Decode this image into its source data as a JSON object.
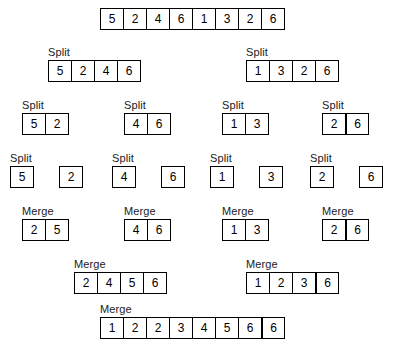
{
  "diagram": {
    "labels": {
      "split": "Split",
      "merge": "Merge"
    },
    "colors": {
      "background": "#ffffff",
      "border": "#000000",
      "text": "#000000"
    },
    "levels": [
      {
        "name": "initial-array",
        "label": "",
        "groups": [
          {
            "name": "root",
            "values": [
              5,
              2,
              4,
              6,
              1,
              3,
              2,
              6
            ],
            "thick_dividers": []
          }
        ]
      },
      {
        "name": "split-level-1",
        "label": "Split",
        "groups": [
          {
            "name": "left-half",
            "values": [
              5,
              2,
              4,
              6
            ],
            "thick_dividers": []
          },
          {
            "name": "right-half",
            "values": [
              1,
              3,
              2,
              6
            ],
            "thick_dividers": []
          }
        ]
      },
      {
        "name": "split-level-2",
        "label": "Split",
        "groups": [
          {
            "name": "pair-1",
            "values": [
              5,
              2
            ],
            "thick_dividers": []
          },
          {
            "name": "pair-2",
            "values": [
              4,
              6
            ],
            "thick_dividers": []
          },
          {
            "name": "pair-3",
            "values": [
              1,
              3
            ],
            "thick_dividers": []
          },
          {
            "name": "pair-4",
            "values": [
              2,
              6
            ],
            "thick_dividers": [
              1
            ]
          }
        ]
      },
      {
        "name": "split-level-3",
        "label": "Split",
        "groups": [
          {
            "name": "single-1",
            "values": [
              5,
              2
            ],
            "separated": true
          },
          {
            "name": "single-2",
            "values": [
              4,
              6
            ],
            "separated": true
          },
          {
            "name": "single-3",
            "values": [
              1,
              3
            ],
            "separated": true
          },
          {
            "name": "single-4",
            "values": [
              2,
              6
            ],
            "separated": true
          }
        ]
      },
      {
        "name": "merge-level-1",
        "label": "Merge",
        "groups": [
          {
            "name": "merged-pair-1",
            "values": [
              2,
              5
            ],
            "thick_dividers": []
          },
          {
            "name": "merged-pair-2",
            "values": [
              4,
              6
            ],
            "thick_dividers": []
          },
          {
            "name": "merged-pair-3",
            "values": [
              1,
              3
            ],
            "thick_dividers": []
          },
          {
            "name": "merged-pair-4",
            "values": [
              2,
              6
            ],
            "thick_dividers": [
              1
            ]
          }
        ]
      },
      {
        "name": "merge-level-2",
        "label": "Merge",
        "groups": [
          {
            "name": "merged-half-left",
            "values": [
              2,
              4,
              5,
              6
            ],
            "thick_dividers": []
          },
          {
            "name": "merged-half-right",
            "values": [
              1,
              2,
              3,
              6
            ],
            "thick_dividers": [
              3
            ]
          }
        ]
      },
      {
        "name": "merge-level-3",
        "label": "Merge",
        "groups": [
          {
            "name": "final-sorted",
            "values": [
              1,
              2,
              2,
              3,
              4,
              5,
              6,
              6
            ],
            "thick_dividers": [
              7
            ]
          }
        ]
      }
    ],
    "positions": [
      [
        {
          "x": 100,
          "y": 8
        }
      ],
      [
        {
          "x": 48,
          "y": 46
        },
        {
          "x": 246,
          "y": 46
        }
      ],
      [
        {
          "x": 22,
          "y": 99
        },
        {
          "x": 124,
          "y": 99
        },
        {
          "x": 222,
          "y": 99
        },
        {
          "x": 322,
          "y": 99
        }
      ],
      [
        {
          "x": 10,
          "y": 152
        },
        {
          "x": 112,
          "y": 152
        },
        {
          "x": 210,
          "y": 152
        },
        {
          "x": 310,
          "y": 152
        }
      ],
      [
        {
          "x": 22,
          "y": 205
        },
        {
          "x": 124,
          "y": 205
        },
        {
          "x": 222,
          "y": 205
        },
        {
          "x": 322,
          "y": 205
        }
      ],
      [
        {
          "x": 74,
          "y": 258
        },
        {
          "x": 246,
          "y": 258
        }
      ],
      [
        {
          "x": 100,
          "y": 303
        }
      ]
    ]
  }
}
